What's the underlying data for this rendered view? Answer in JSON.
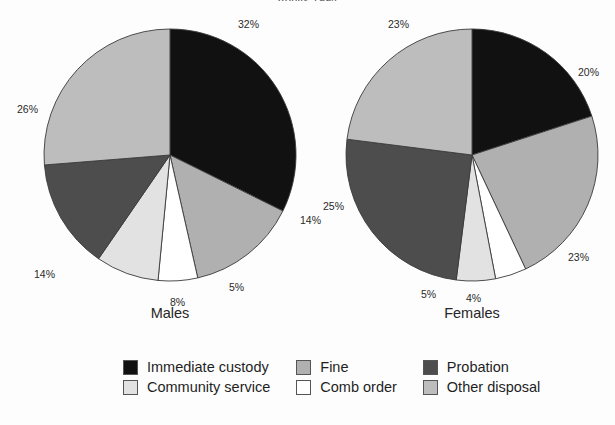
{
  "chart_data": {
    "type": "pie",
    "title": "Adults 1994",
    "categories": [
      "Immediate custody",
      "Community service",
      "Fine",
      "Comb order",
      "Probation",
      "Other disposal"
    ],
    "colors": [
      "#111111",
      "#e2e2e2",
      "#b0b0b0",
      "#ffffff",
      "#4d4d4d",
      "#bdbdbd"
    ],
    "charts": [
      {
        "name": "Males",
        "caption": "Males",
        "slices": [
          {
            "label": "Immediate custody",
            "value": 32,
            "display": "32%",
            "color": "#111111"
          },
          {
            "label": "Fine",
            "value": 14,
            "display": "14%",
            "color": "#b0b0b0"
          },
          {
            "label": "Comb order",
            "value": 5,
            "display": "5%",
            "color": "#ffffff"
          },
          {
            "label": "Community service",
            "value": 8,
            "display": "8%",
            "color": "#e2e2e2"
          },
          {
            "label": "Probation",
            "value": 14,
            "display": "14%",
            "color": "#4d4d4d"
          },
          {
            "label": "Other disposal",
            "value": 26,
            "display": "26%",
            "color": "#bdbdbd"
          }
        ]
      },
      {
        "name": "Females",
        "caption": "Females",
        "slices": [
          {
            "label": "Immediate custody",
            "value": 20,
            "display": "20%",
            "color": "#111111"
          },
          {
            "label": "Fine",
            "value": 23,
            "display": "23%",
            "color": "#b0b0b0"
          },
          {
            "label": "Comb order",
            "value": 4,
            "display": "4%",
            "color": "#ffffff"
          },
          {
            "label": "Community service",
            "value": 5,
            "display": "5%",
            "color": "#e2e2e2"
          },
          {
            "label": "Probation",
            "value": 25,
            "display": "25%",
            "color": "#4d4d4d"
          },
          {
            "label": "Other disposal",
            "value": 23,
            "display": "23%",
            "color": "#bdbdbd"
          }
        ]
      }
    ],
    "legend": {
      "position": "bottom",
      "entries": [
        {
          "label": "Immediate custody",
          "color": "#111111"
        },
        {
          "label": "Fine",
          "color": "#b0b0b0"
        },
        {
          "label": "Probation",
          "color": "#4d4d4d"
        },
        {
          "label": "Community service",
          "color": "#e2e2e2"
        },
        {
          "label": "Comb order",
          "color": "#ffffff"
        },
        {
          "label": "Other disposal",
          "color": "#bdbdbd"
        }
      ]
    },
    "grid": false,
    "xlabel": "",
    "ylabel": ""
  }
}
